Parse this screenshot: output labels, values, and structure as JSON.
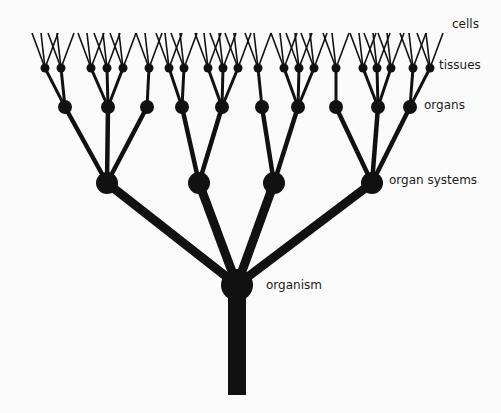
{
  "diagram": {
    "type": "hierarchy-tree",
    "colors": {
      "ink": "#111111",
      "background": "#fbfbfb",
      "text": "#1a1a1a"
    },
    "levels": [
      {
        "id": "cells",
        "label": "cells",
        "label_pos": [
          452,
          24
        ]
      },
      {
        "id": "tissues",
        "label": "tissues",
        "label_pos": [
          439,
          65
        ]
      },
      {
        "id": "organs",
        "label": "organs",
        "label_pos": [
          424,
          105
        ]
      },
      {
        "id": "organ_systems",
        "label": "organ systems",
        "label_pos": [
          389,
          180
        ]
      },
      {
        "id": "organism",
        "label": "organism",
        "label_pos": [
          266,
          285
        ]
      }
    ],
    "trunk": {
      "x": 237,
      "top": 285,
      "bottom": 395,
      "width": 18
    },
    "organism": {
      "x": 237,
      "y": 285,
      "r": 16
    },
    "organ_systems": [
      {
        "x": 107,
        "y": 183,
        "r": 11,
        "organs": [
          {
            "x": 65,
            "y": 107,
            "tissues": [
              45,
              61
            ]
          },
          {
            "x": 108,
            "y": 107,
            "tissues": [
              91,
              107,
              123
            ]
          },
          {
            "x": 147,
            "y": 107,
            "tissues": [
              149
            ]
          }
        ]
      },
      {
        "x": 199,
        "y": 183,
        "r": 11,
        "organs": [
          {
            "x": 182,
            "y": 107,
            "tissues": [
              169,
              184
            ]
          }
        ]
      },
      {
        "x": 199,
        "y": 183,
        "r": 11,
        "organs": [
          {
            "x": 222,
            "y": 107,
            "tissues": [
              208,
              223,
              238
            ]
          }
        ]
      },
      {
        "x": 274,
        "y": 183,
        "r": 11,
        "organs": [
          {
            "x": 262,
            "y": 107,
            "tissues": [
              258
            ]
          },
          {
            "x": 298,
            "y": 107,
            "tissues": [
              284,
              299,
              314
            ]
          }
        ]
      },
      {
        "x": 372,
        "y": 183,
        "r": 11,
        "organs": [
          {
            "x": 336,
            "y": 107,
            "tissues": [
              336
            ]
          },
          {
            "x": 378,
            "y": 107,
            "tissues": [
              363,
              377,
              391
            ]
          },
          {
            "x": 410,
            "y": 107,
            "tissues": [
              413,
              430
            ]
          }
        ]
      }
    ],
    "tissue_y": 68,
    "cell_top_y": 33,
    "cells_per_tissue": 3
  }
}
